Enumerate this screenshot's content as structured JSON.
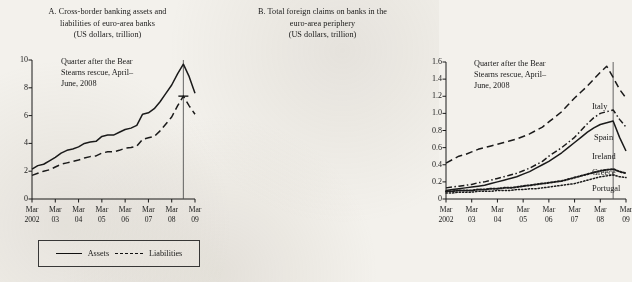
{
  "figure": {
    "background_color": "#f3f1ec",
    "ink_color": "#1a1a1a"
  },
  "panel_a": {
    "title_line1": "A. Cross-border banking assets and",
    "title_line2": "liabilities of euro-area banks",
    "title_line3": "(US dollars, trillion)",
    "annotation_line1": "Quarter after the Bear",
    "annotation_line2": "Stearns rescue, April–",
    "annotation_line3": "June, 2008",
    "legend": {
      "assets_label": "Assets",
      "liabilities_label": "Liabilities"
    }
  },
  "panel_b": {
    "title_line1": "B. Total foreign claims on banks in the",
    "title_line2": "euro-area periphery",
    "title_line3": "(US dollars, trillion)",
    "annotation_line1": "Quarter after the Bear",
    "annotation_line2": "Stearns rescue, April–",
    "annotation_line3": "June, 2008",
    "series_labels": {
      "italy": "Italy",
      "spain": "Spain",
      "ireland": "Ireland",
      "greece": "Greece",
      "portugal": "Portugal"
    }
  },
  "chart_data": [
    {
      "type": "line",
      "panel": "A",
      "title": "A. Cross-border banking assets and liabilities of euro-area banks (US dollars, trillion)",
      "xlabel": "",
      "ylabel": "US dollars, trillion",
      "ylim": [
        0,
        10
      ],
      "yticks": [
        0,
        2,
        4,
        6,
        8,
        10
      ],
      "ytick_labels": [
        "0",
        "2",
        "4",
        "6",
        "8",
        "10"
      ],
      "xlim": [
        2002.0,
        2009.0
      ],
      "xticks": [
        2002,
        2003,
        2004,
        2005,
        2006,
        2007,
        2008,
        2009
      ],
      "xtick_labels_top": [
        "Mar",
        "Mar",
        "Mar",
        "Mar",
        "Mar",
        "Mar",
        "Mar",
        "Mar"
      ],
      "xtick_labels_bottom": [
        "2002",
        "03",
        "04",
        "05",
        "06",
        "07",
        "08",
        "09"
      ],
      "grid": false,
      "legend_position": "below-axes",
      "annotation": {
        "text": "Quarter after the Bear Stearns rescue, April–June, 2008",
        "vline_x": 2008.5
      },
      "x": [
        2002.0,
        2002.25,
        2002.5,
        2002.75,
        2003.0,
        2003.25,
        2003.5,
        2003.75,
        2004.0,
        2004.25,
        2004.5,
        2004.75,
        2005.0,
        2005.25,
        2005.5,
        2005.75,
        2006.0,
        2006.25,
        2006.5,
        2006.75,
        2007.0,
        2007.25,
        2007.5,
        2007.75,
        2008.0,
        2008.25,
        2008.5,
        2008.75,
        2009.0
      ],
      "series": [
        {
          "name": "Assets",
          "style": "solid",
          "values": [
            2.15,
            2.4,
            2.5,
            2.75,
            3.0,
            3.3,
            3.5,
            3.6,
            3.75,
            4.0,
            4.1,
            4.15,
            4.5,
            4.6,
            4.6,
            4.8,
            5.0,
            5.1,
            5.3,
            6.1,
            6.2,
            6.5,
            7.0,
            7.6,
            8.2,
            9.0,
            9.7,
            8.8,
            7.6
          ]
        },
        {
          "name": "Liabilities",
          "style": "dashed",
          "values": [
            1.7,
            1.85,
            2.0,
            2.1,
            2.3,
            2.5,
            2.6,
            2.7,
            2.8,
            2.95,
            3.05,
            3.1,
            3.3,
            3.4,
            3.4,
            3.5,
            3.65,
            3.7,
            3.8,
            4.3,
            4.4,
            4.5,
            4.9,
            5.4,
            5.9,
            6.7,
            7.4,
            6.7,
            6.1
          ]
        }
      ]
    },
    {
      "type": "line",
      "panel": "B",
      "title": "B. Total foreign claims on banks in the euro-area periphery (US dollars, trillion)",
      "xlabel": "",
      "ylabel": "US dollars, trillion",
      "ylim": [
        0,
        1.6
      ],
      "yticks": [
        0,
        0.2,
        0.4,
        0.6,
        0.8,
        1.0,
        1.2,
        1.4,
        1.6
      ],
      "ytick_labels": [
        "0",
        "0.2",
        "0.4",
        "0.6",
        "0.8",
        "1.0",
        "1.2",
        "1.4",
        "1.6"
      ],
      "xlim": [
        2002.0,
        2009.0
      ],
      "xticks": [
        2002,
        2003,
        2004,
        2005,
        2006,
        2007,
        2008,
        2009
      ],
      "xtick_labels_top": [
        "Mar",
        "Mar",
        "Mar",
        "Mar",
        "Mar",
        "Mar",
        "Mar",
        "Mar"
      ],
      "xtick_labels_bottom": [
        "2002",
        "03",
        "04",
        "05",
        "06",
        "07",
        "08",
        "09"
      ],
      "grid": false,
      "legend_position": "inline-right-labels",
      "annotation": {
        "text": "Quarter after the Bear Stearns rescue, April–June, 2008",
        "vline_x": 2008.5
      },
      "x": [
        2002.0,
        2002.25,
        2002.5,
        2002.75,
        2003.0,
        2003.25,
        2003.5,
        2003.75,
        2004.0,
        2004.25,
        2004.5,
        2004.75,
        2005.0,
        2005.25,
        2005.5,
        2005.75,
        2006.0,
        2006.25,
        2006.5,
        2006.75,
        2007.0,
        2007.25,
        2007.5,
        2007.75,
        2008.0,
        2008.25,
        2008.5,
        2008.75,
        2009.0
      ],
      "series": [
        {
          "name": "Italy",
          "style": "dashed",
          "values": [
            0.42,
            0.46,
            0.5,
            0.52,
            0.55,
            0.58,
            0.6,
            0.62,
            0.64,
            0.66,
            0.68,
            0.7,
            0.73,
            0.76,
            0.8,
            0.84,
            0.9,
            0.96,
            1.02,
            1.1,
            1.18,
            1.25,
            1.32,
            1.4,
            1.48,
            1.55,
            1.42,
            1.28,
            1.18
          ]
        },
        {
          "name": "Spain",
          "style": "dash-dot",
          "values": [
            0.13,
            0.14,
            0.15,
            0.16,
            0.17,
            0.19,
            0.2,
            0.22,
            0.24,
            0.26,
            0.28,
            0.3,
            0.33,
            0.36,
            0.4,
            0.44,
            0.5,
            0.55,
            0.6,
            0.66,
            0.72,
            0.8,
            0.88,
            0.95,
            1.0,
            1.02,
            1.04,
            0.93,
            0.84
          ]
        },
        {
          "name": "Ireland",
          "style": "solid",
          "values": [
            0.1,
            0.11,
            0.12,
            0.13,
            0.14,
            0.15,
            0.16,
            0.18,
            0.2,
            0.22,
            0.24,
            0.26,
            0.29,
            0.32,
            0.36,
            0.4,
            0.44,
            0.49,
            0.54,
            0.6,
            0.66,
            0.72,
            0.78,
            0.83,
            0.87,
            0.89,
            0.91,
            0.72,
            0.56
          ]
        },
        {
          "name": "Greece",
          "style": "dotted",
          "values": [
            0.09,
            0.09,
            0.1,
            0.1,
            0.1,
            0.11,
            0.11,
            0.12,
            0.12,
            0.13,
            0.13,
            0.14,
            0.15,
            0.16,
            0.17,
            0.18,
            0.19,
            0.2,
            0.21,
            0.23,
            0.25,
            0.27,
            0.29,
            0.31,
            0.33,
            0.34,
            0.35,
            0.32,
            0.3
          ]
        },
        {
          "name": "Portugal",
          "style": "dotted-thin",
          "values": [
            0.07,
            0.07,
            0.08,
            0.08,
            0.08,
            0.09,
            0.09,
            0.09,
            0.1,
            0.1,
            0.1,
            0.11,
            0.11,
            0.12,
            0.12,
            0.13,
            0.14,
            0.15,
            0.16,
            0.17,
            0.18,
            0.2,
            0.22,
            0.24,
            0.26,
            0.27,
            0.28,
            0.26,
            0.25
          ]
        }
      ]
    }
  ]
}
